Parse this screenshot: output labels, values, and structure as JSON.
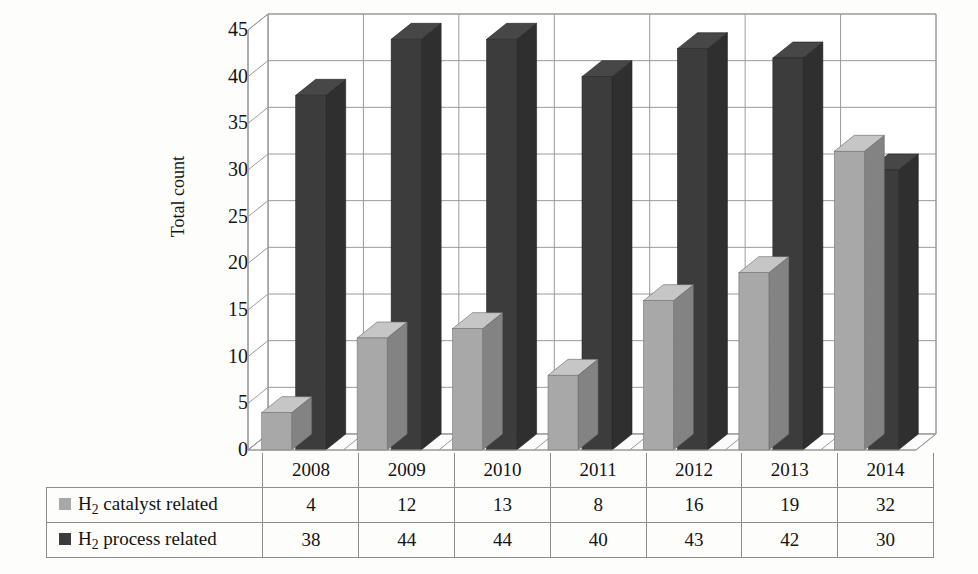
{
  "chart_data": {
    "type": "bar",
    "title": "",
    "subtitle": "",
    "xlabel": "",
    "ylabel": "Total count",
    "categories": [
      "2008",
      "2009",
      "2010",
      "2011",
      "2012",
      "2013",
      "2014"
    ],
    "series": [
      {
        "name": "H2 catalyst related",
        "label_html": "H<sub>2</sub> catalyst related",
        "label_prefix": "H",
        "label_sub": "2",
        "label_suffix": " catalyst related",
        "color": "#a8a8a8",
        "values": [
          4,
          12,
          13,
          8,
          16,
          19,
          32
        ]
      },
      {
        "name": "H2 process related",
        "label_html": "H<sub>2</sub> process related",
        "label_prefix": "H",
        "label_sub": "2",
        "label_suffix": " process related",
        "color": "#3c3c3c",
        "values": [
          38,
          44,
          44,
          40,
          43,
          42,
          30
        ]
      }
    ],
    "ylim": [
      0,
      45
    ],
    "ytick_step": 5,
    "yticks": [
      "45",
      "40",
      "35",
      "30",
      "25",
      "20",
      "15",
      "10",
      "5",
      "0"
    ],
    "grid": true,
    "legend_position": "table-left-column",
    "style": "3d-clustered-column",
    "plot_background": "#ffffff",
    "grid_color": "#9a9a9a",
    "page_background": "#fdfdfc"
  },
  "axis": {
    "y_title": "Total count",
    "y_ticks": [
      "45",
      "40",
      "35",
      "30",
      "25",
      "20",
      "15",
      "10",
      "5",
      "0"
    ]
  },
  "table": {
    "corner_label": "",
    "year_headers": [
      "2008",
      "2009",
      "2010",
      "2011",
      "2012",
      "2013",
      "2014"
    ],
    "rows": [
      {
        "legend_prefix": "H",
        "legend_sub": "2",
        "legend_suffix": " catalyst related",
        "swatch_color": "#a8a8a8",
        "values": [
          "4",
          "12",
          "13",
          "8",
          "16",
          "19",
          "32"
        ]
      },
      {
        "legend_prefix": "H",
        "legend_sub": "2",
        "legend_suffix": " process related",
        "swatch_color": "#3c3c3c",
        "values": [
          "38",
          "44",
          "44",
          "40",
          "43",
          "42",
          "30"
        ]
      }
    ]
  }
}
